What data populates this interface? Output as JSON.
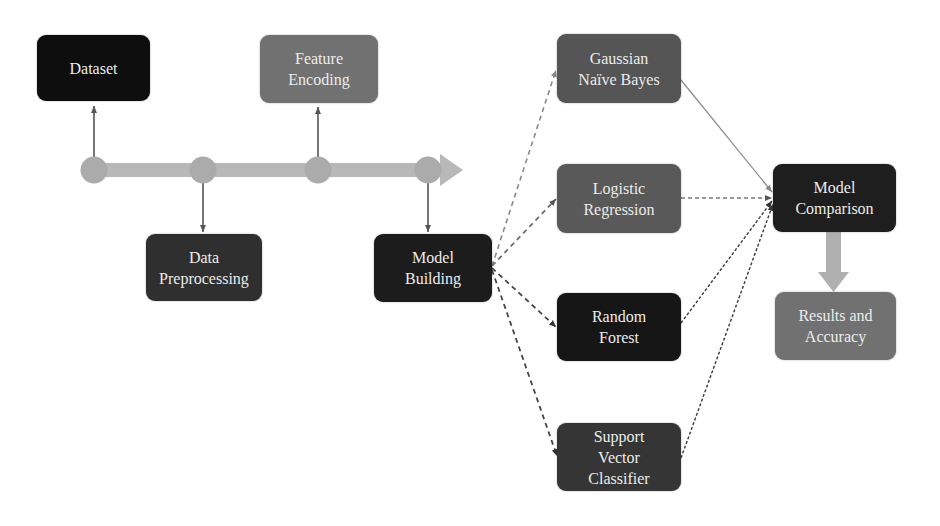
{
  "diagram": {
    "nodes": {
      "dataset": {
        "lines": [
          "Dataset"
        ],
        "color": "#0e0e0e"
      },
      "feature_encoding": {
        "lines": [
          "Feature",
          "Encoding"
        ],
        "color": "#717171"
      },
      "data_preprocessing": {
        "lines": [
          "Data",
          "Preprocessing"
        ],
        "color": "#2f2f2f"
      },
      "model_building": {
        "lines": [
          "Model",
          "Building"
        ],
        "color": "#1c1c1c"
      },
      "gaussian_nb": {
        "lines": [
          "Gaussian",
          "Naïve Bayes"
        ],
        "color": "#555555"
      },
      "logistic_regression": {
        "lines": [
          "Logistic",
          "Regression"
        ],
        "color": "#595959"
      },
      "random_forest": {
        "lines": [
          "Random",
          "Forest"
        ],
        "color": "#161616"
      },
      "svc": {
        "lines": [
          "Support",
          "Vector",
          "Classifier"
        ],
        "color": "#353535"
      },
      "model_comparison": {
        "lines": [
          "Model",
          "Comparison"
        ],
        "color": "#1e1e1e"
      },
      "results": {
        "lines": [
          "Results and",
          "Accuracy"
        ],
        "color": "#717171"
      }
    },
    "timeline": {
      "color": "#b5b5b5",
      "node_color": "#a9a9a9"
    },
    "edges": [
      {
        "from": "model_building",
        "to": "gaussian_nb",
        "style": "dashed"
      },
      {
        "from": "model_building",
        "to": "logistic_regression",
        "style": "dashed"
      },
      {
        "from": "model_building",
        "to": "random_forest",
        "style": "dashed"
      },
      {
        "from": "model_building",
        "to": "svc",
        "style": "dashed"
      },
      {
        "from": "gaussian_nb",
        "to": "model_comparison",
        "style": "solid"
      },
      {
        "from": "logistic_regression",
        "to": "model_comparison",
        "style": "dashed"
      },
      {
        "from": "random_forest",
        "to": "model_comparison",
        "style": "dashed"
      },
      {
        "from": "svc",
        "to": "model_comparison",
        "style": "dashed"
      },
      {
        "from": "model_comparison",
        "to": "results",
        "style": "block-arrow"
      }
    ]
  }
}
